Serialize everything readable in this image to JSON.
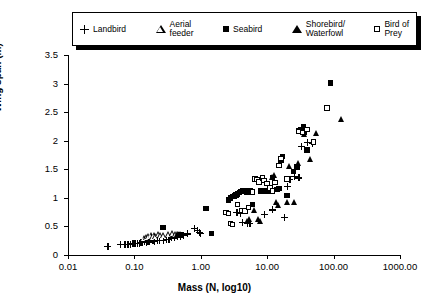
{
  "chart_data": {
    "type": "scatter",
    "title": "",
    "xlabel": "Mass (N, log10)",
    "ylabel": "Wing span (m)",
    "xscale": "log",
    "yscale": "linear",
    "xlim": [
      0.01,
      1000.0
    ],
    "ylim": [
      0,
      3.5
    ],
    "xticks": [
      0.01,
      0.1,
      1.0,
      10.0,
      100.0,
      1000.0
    ],
    "xtick_labels": [
      "0.01",
      "0.10",
      "1.00",
      "10.00",
      "100.00",
      "1000.00"
    ],
    "yticks": [
      0,
      0.5,
      1,
      1.5,
      2,
      2.5,
      3,
      3.5
    ],
    "ytick_labels": [
      "0",
      "0.5",
      "1",
      "1.5",
      "2",
      "2.5",
      "3",
      "3.5"
    ],
    "grid": false,
    "legend_position": "top",
    "series": [
      {
        "name": "Landbird",
        "marker": "plus",
        "fill": "none",
        "points": [
          [
            0.04,
            0.15
          ],
          [
            0.062,
            0.18
          ],
          [
            0.072,
            0.18
          ],
          [
            0.08,
            0.18
          ],
          [
            0.088,
            0.19
          ],
          [
            0.095,
            0.2
          ],
          [
            0.1,
            0.2
          ],
          [
            0.105,
            0.21
          ],
          [
            0.11,
            0.2
          ],
          [
            0.12,
            0.21
          ],
          [
            0.125,
            0.22
          ],
          [
            0.13,
            0.22
          ],
          [
            0.14,
            0.23
          ],
          [
            0.15,
            0.22
          ],
          [
            0.16,
            0.24
          ],
          [
            0.17,
            0.23
          ],
          [
            0.19,
            0.25
          ],
          [
            0.2,
            0.24
          ],
          [
            0.22,
            0.25
          ],
          [
            0.24,
            0.26
          ],
          [
            0.27,
            0.25
          ],
          [
            0.3,
            0.27
          ],
          [
            0.33,
            0.28
          ],
          [
            0.36,
            0.3
          ],
          [
            0.4,
            0.3
          ],
          [
            0.45,
            0.32
          ],
          [
            0.5,
            0.33
          ],
          [
            0.55,
            0.35
          ],
          [
            0.62,
            0.37
          ],
          [
            0.8,
            0.46
          ],
          [
            0.9,
            0.43
          ],
          [
            0.95,
            0.39
          ],
          [
            1.0,
            0.38
          ],
          [
            3.5,
            0.75
          ],
          [
            4.0,
            0.73
          ],
          [
            4.2,
            0.57
          ],
          [
            5.0,
            0.55
          ],
          [
            5.5,
            0.56
          ],
          [
            9.0,
            0.71
          ],
          [
            12.0,
            0.79
          ],
          [
            18.0,
            0.66
          ],
          [
            20.0,
            1.2
          ],
          [
            22.0,
            1.33
          ],
          [
            26.0,
            1.37
          ],
          [
            30.0,
            1.35
          ],
          [
            33.0,
            1.9
          ],
          [
            40.0,
            1.97
          ],
          [
            48.0,
            1.96
          ]
        ]
      },
      {
        "name": "Aerial feeder",
        "marker": "triangle",
        "fill": "none",
        "points": [
          [
            0.14,
            0.3
          ],
          [
            0.155,
            0.31
          ],
          [
            0.165,
            0.33
          ],
          [
            0.18,
            0.34
          ],
          [
            0.19,
            0.32
          ],
          [
            0.2,
            0.35
          ],
          [
            0.21,
            0.33
          ],
          [
            0.23,
            0.36
          ],
          [
            0.25,
            0.34
          ],
          [
            0.28,
            0.35
          ],
          [
            0.33,
            0.37
          ],
          [
            0.38,
            0.38
          ],
          [
            0.42,
            0.36
          ],
          [
            0.46,
            0.37
          ],
          [
            0.5,
            0.36
          ]
        ]
      },
      {
        "name": "Seabird",
        "marker": "square",
        "fill": "solid",
        "points": [
          [
            0.27,
            0.48
          ],
          [
            0.5,
            0.35
          ],
          [
            1.2,
            0.81
          ],
          [
            1.45,
            0.38
          ],
          [
            2.6,
            0.96
          ],
          [
            2.8,
            1.0
          ],
          [
            3.0,
            1.02
          ],
          [
            3.2,
            1.03
          ],
          [
            3.4,
            1.05
          ],
          [
            3.6,
            1.07
          ],
          [
            3.8,
            1.09
          ],
          [
            4.0,
            1.11
          ],
          [
            4.3,
            1.12
          ],
          [
            4.6,
            1.13
          ],
          [
            5.0,
            1.1
          ],
          [
            5.5,
            1.12
          ],
          [
            6.0,
            0.88
          ],
          [
            8.0,
            1.12
          ],
          [
            9.0,
            1.13
          ],
          [
            10.0,
            1.11
          ],
          [
            12.0,
            1.36
          ],
          [
            14.0,
            1.15
          ],
          [
            15.0,
            1.16
          ],
          [
            16.0,
            1.66
          ],
          [
            17.0,
            1.72
          ],
          [
            20.0,
            1.04
          ],
          [
            25.0,
            1.46
          ],
          [
            28.0,
            1.54
          ],
          [
            30.0,
            2.17
          ],
          [
            32.0,
            2.2
          ],
          [
            35.0,
            2.25
          ],
          [
            36.0,
            2.15
          ],
          [
            40.0,
            1.84
          ],
          [
            90.0,
            3.01
          ]
        ]
      },
      {
        "name": "Shorebird/Waterfowl",
        "marker": "triangle",
        "fill": "solid",
        "points": [
          [
            0.45,
            0.36
          ],
          [
            0.5,
            0.35
          ],
          [
            5.0,
            0.6
          ],
          [
            5.5,
            0.63
          ],
          [
            6.5,
            0.78
          ],
          [
            7.5,
            0.62
          ],
          [
            8.0,
            0.6
          ],
          [
            12.0,
            1.37
          ],
          [
            13.0,
            1.39
          ],
          [
            14.0,
            0.92
          ],
          [
            15.0,
            0.88
          ],
          [
            20.0,
            0.93
          ],
          [
            22.0,
            1.55
          ],
          [
            26.0,
            0.92
          ],
          [
            30.0,
            1.6
          ],
          [
            36.0,
            2.12
          ],
          [
            45.0,
            1.67
          ],
          [
            55.0,
            2.13
          ],
          [
            130.0,
            2.38
          ]
        ]
      },
      {
        "name": "Bird of Prey",
        "marker": "square",
        "fill": "none",
        "points": [
          [
            2.4,
            0.74
          ],
          [
            2.6,
            0.73
          ],
          [
            2.8,
            0.55
          ],
          [
            3.0,
            0.53
          ],
          [
            3.6,
            0.88
          ],
          [
            4.2,
            0.78
          ],
          [
            4.6,
            0.77
          ],
          [
            5.2,
            0.83
          ],
          [
            6.0,
            1.1
          ],
          [
            6.5,
            1.33
          ],
          [
            7.0,
            1.32
          ],
          [
            7.5,
            1.28
          ],
          [
            8.5,
            1.35
          ],
          [
            9.0,
            1.3
          ],
          [
            10.0,
            1.25
          ],
          [
            11.0,
            1.17
          ],
          [
            12.0,
            1.12
          ],
          [
            13.0,
            1.27
          ],
          [
            15.0,
            1.57
          ],
          [
            16.0,
            1.69
          ],
          [
            20.0,
            1.33
          ],
          [
            30.0,
            2.16
          ],
          [
            34.0,
            2.14
          ],
          [
            40.0,
            2.2
          ],
          [
            50.0,
            1.98
          ],
          [
            80.0,
            2.57
          ]
        ]
      }
    ]
  },
  "legend": {
    "entries": [
      {
        "label": "Landbird",
        "marker": "plus-marker"
      },
      {
        "label": "Aerial\nfeeder",
        "marker": "open-triangle-marker"
      },
      {
        "label": "Seabird",
        "marker": "filled-square-marker"
      },
      {
        "label": "Shorebird/\nWaterfowl",
        "marker": "filled-triangle-marker"
      },
      {
        "label": "Bird of\nPrey",
        "marker": "open-square-marker"
      }
    ]
  },
  "axes": {
    "x_title": "Mass (N, log10)",
    "y_title": "Wing span (m)"
  }
}
